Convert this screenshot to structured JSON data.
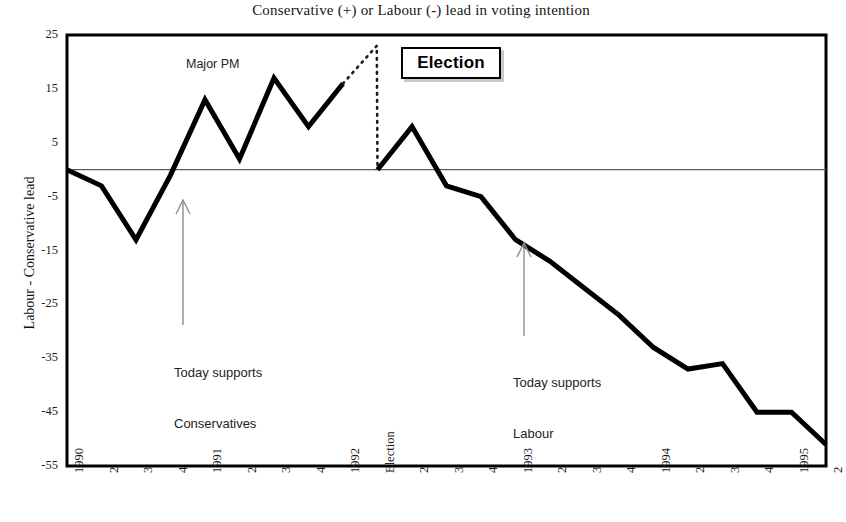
{
  "chart_data": {
    "type": "line",
    "title": "Conservative (+) or Labour (-) lead in voting intention",
    "xlabel": "",
    "ylabel": "Labour - Conservative lead",
    "ylim": [
      -55,
      25
    ],
    "y_ticks": [
      25,
      15,
      5,
      -5,
      -15,
      -25,
      -35,
      -45,
      -55
    ],
    "grid": false,
    "legend": "none",
    "zero_line": 0,
    "categories": [
      "1990",
      "2",
      "3",
      "4",
      "1991",
      "2",
      "3",
      "4",
      "1992",
      "Election",
      "2",
      "3",
      "4",
      "1993",
      "2",
      "3",
      "4",
      "1994",
      "2",
      "3",
      "4",
      "1995",
      "2"
    ],
    "series": [
      {
        "name": "Labour - Conservative lead (solid)",
        "style": "solid",
        "values": [
          0,
          -3,
          -13,
          -1,
          13,
          2,
          17,
          8,
          16,
          null,
          null,
          null,
          null,
          null,
          null,
          null,
          null,
          null,
          null,
          null,
          null,
          null,
          null
        ]
      },
      {
        "name": "Election period (dotted)",
        "style": "dotted",
        "x": [
          "1992",
          "1992.5",
          "Election"
        ],
        "values": [
          16,
          23,
          0
        ]
      },
      {
        "name": "Labour - Conservative lead post-election (solid)",
        "style": "solid",
        "values": [
          null,
          null,
          null,
          null,
          null,
          null,
          null,
          null,
          null,
          0,
          8,
          -3,
          -5,
          -13,
          -17,
          -22,
          -27,
          -33,
          -37,
          -36,
          -45,
          -45,
          -51
        ]
      }
    ],
    "annotations": [
      {
        "name": "major-pm",
        "text": "Major PM",
        "x": "1991",
        "y": 21
      },
      {
        "name": "today-supports-conservatives",
        "text": "Today supports\nConservatives",
        "x": "4",
        "y": -31,
        "arrow": "up"
      },
      {
        "name": "today-supports-labour",
        "text": "Today supports\nLabour",
        "x": "1993",
        "y": -33,
        "arrow": "up"
      },
      {
        "name": "election-label",
        "text": "Election",
        "x": "Election",
        "y": 22,
        "boxed": true
      }
    ]
  },
  "labels": {
    "title": "Conservative (+) or Labour (-) lead in voting intention",
    "y_axis_title": "Labour - Conservative lead",
    "annot_major_pm": "Major PM",
    "annot_today_cons_line1": "Today supports",
    "annot_today_cons_line2": "Conservatives",
    "annot_today_lab_line1": "Today supports",
    "annot_today_lab_line2": "Labour",
    "election_box": "Election"
  },
  "colors": {
    "line": "#000000",
    "axis": "#000000",
    "zero_line": "#555555",
    "arrow": "#888888",
    "text": "#1a1a1a",
    "background": "#ffffff"
  }
}
